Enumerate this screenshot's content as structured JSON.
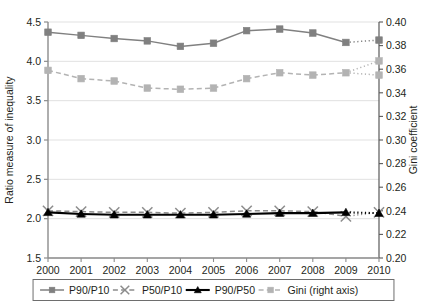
{
  "chart_data": {
    "type": "line",
    "title": "",
    "xlabel": "",
    "ylabel": "Ratio measure of inequality",
    "y2label": "Gini coefficient",
    "categories": [
      "2000",
      "2001",
      "2002",
      "2003",
      "2004",
      "2005",
      "2006",
      "2007",
      "2008",
      "2009",
      "2010"
    ],
    "ylim": [
      1.5,
      4.5
    ],
    "ytick_step": 0.5,
    "yticks": [
      "1.5",
      "2.0",
      "2.5",
      "3.0",
      "3.5",
      "4.0",
      "4.5"
    ],
    "y2lim": [
      0.2,
      0.4
    ],
    "y2tick_step": 0.02,
    "y2ticks": [
      "0.20",
      "0.22",
      "0.24",
      "0.26",
      "0.28",
      "0.30",
      "0.32",
      "0.34",
      "0.36",
      "0.38",
      "0.40"
    ],
    "grid": true,
    "grid_axis": "y",
    "legend_position": "bottom",
    "series": [
      {
        "name": "P90/P10",
        "axis": "left",
        "color": "#808080",
        "marker": "square",
        "linestyle": "solid",
        "dotted_from_index": 9,
        "values": [
          4.37,
          4.33,
          4.29,
          4.26,
          4.19,
          4.23,
          4.39,
          4.41,
          4.36,
          4.24,
          4.27
        ]
      },
      {
        "name": "P50/P10",
        "axis": "left",
        "color": "#8c8c8c",
        "marker": "x",
        "linestyle": "dashed",
        "dotted_from_index": 9,
        "values": [
          2.1,
          2.09,
          2.08,
          2.08,
          2.07,
          2.08,
          2.1,
          2.1,
          2.09,
          2.03,
          2.08
        ]
      },
      {
        "name": "P90/P50",
        "axis": "left",
        "color": "#000000",
        "marker": "triangle",
        "linestyle": "solid",
        "dotted_from_index": 9,
        "values": [
          2.08,
          2.06,
          2.05,
          2.05,
          2.05,
          2.05,
          2.06,
          2.07,
          2.07,
          2.08,
          2.07
        ]
      },
      {
        "name": "Gini (right axis)",
        "axis": "right",
        "color": "#b3b3b3",
        "marker": "square",
        "linestyle": "dashed",
        "dotted_from_index": 9,
        "values": [
          0.359,
          0.352,
          0.35,
          0.344,
          0.343,
          0.344,
          0.352,
          0.357,
          0.355,
          0.357,
          0.367
        ],
        "alt_endpoint": 0.355
      }
    ],
    "legend": [
      {
        "label": "P90/P10",
        "color": "#808080",
        "marker": "square",
        "linestyle": "solid"
      },
      {
        "label": "P50/P10",
        "color": "#8c8c8c",
        "marker": "x",
        "linestyle": "dashed"
      },
      {
        "label": "P90/P50",
        "color": "#000000",
        "marker": "triangle",
        "linestyle": "solid"
      },
      {
        "label": "Gini (right axis)",
        "color": "#b3b3b3",
        "marker": "square",
        "linestyle": "dashed"
      }
    ]
  }
}
